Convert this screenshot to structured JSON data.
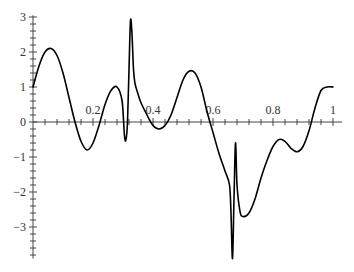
{
  "chart_data": {
    "type": "line",
    "title": "",
    "xlabel": "",
    "ylabel": "",
    "xlim": [
      0,
      1
    ],
    "ylim": [
      -4,
      3.2
    ],
    "grid": false,
    "legend": null,
    "x_ticks": [
      {
        "value": 0.2,
        "label": "0.2"
      },
      {
        "value": 0.4,
        "label": "0.4"
      },
      {
        "value": 0.6,
        "label": "0.6"
      },
      {
        "value": 0.8,
        "label": "0.8"
      },
      {
        "value": 1,
        "label": "1"
      }
    ],
    "y_ticks": [
      {
        "value": 3,
        "label": "3"
      },
      {
        "value": 2,
        "label": "2"
      },
      {
        "value": 1,
        "label": "1"
      },
      {
        "value": 0,
        "label": "0"
      },
      {
        "value": -1,
        "label": "−1"
      },
      {
        "value": -2,
        "label": "−2"
      },
      {
        "value": -3,
        "label": "−3"
      }
    ],
    "series": [
      {
        "name": "f(x)",
        "color": "#000000",
        "x": [
          0,
          0.02,
          0.04,
          0.06,
          0.08,
          0.1,
          0.12,
          0.14,
          0.16,
          0.18,
          0.2,
          0.22,
          0.24,
          0.26,
          0.28,
          0.297,
          0.305,
          0.31,
          0.315,
          0.32,
          0.325,
          0.33,
          0.335,
          0.34,
          0.35,
          0.36,
          0.38,
          0.4,
          0.42,
          0.44,
          0.46,
          0.48,
          0.5,
          0.52,
          0.54,
          0.56,
          0.58,
          0.6,
          0.62,
          0.64,
          0.655,
          0.66,
          0.665,
          0.67,
          0.675,
          0.68,
          0.69,
          0.7,
          0.72,
          0.74,
          0.76,
          0.78,
          0.8,
          0.82,
          0.84,
          0.86,
          0.88,
          0.9,
          0.92,
          0.94,
          0.96,
          0.98,
          1.0
        ],
        "y": [
          1.0,
          1.6,
          2.0,
          2.1,
          1.9,
          1.4,
          0.7,
          0.0,
          -0.55,
          -0.8,
          -0.6,
          -0.1,
          0.5,
          0.9,
          1.0,
          0.6,
          -0.4,
          -0.5,
          0.0,
          1.5,
          2.9,
          2.5,
          1.5,
          1.1,
          0.8,
          0.55,
          0.2,
          -0.1,
          -0.2,
          -0.1,
          0.2,
          0.7,
          1.2,
          1.45,
          1.4,
          1.0,
          0.3,
          -0.3,
          -0.9,
          -1.4,
          -1.8,
          -2.6,
          -3.9,
          -2.2,
          -0.6,
          -1.8,
          -2.55,
          -2.7,
          -2.6,
          -2.2,
          -1.6,
          -1.1,
          -0.7,
          -0.5,
          -0.55,
          -0.75,
          -0.85,
          -0.7,
          -0.25,
          0.4,
          0.9,
          1.0,
          1.0
        ]
      }
    ]
  }
}
